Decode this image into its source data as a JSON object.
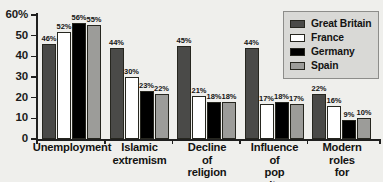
{
  "chart_data": {
    "type": "bar",
    "title": "",
    "xlabel": "",
    "ylabel": "",
    "ylim": [
      0,
      60
    ],
    "yticks": [
      "0",
      "10",
      "20",
      "30",
      "40",
      "50",
      "60%"
    ],
    "ytick_values": [
      0,
      10,
      20,
      30,
      40,
      50,
      60
    ],
    "grid": false,
    "legend_position": "top-right",
    "value_suffix": "%",
    "categories": [
      "Unemployment",
      "Islamic\nextremism",
      "Decline of\nreligion",
      "Influence of\npop culture",
      "Modern roles\nfor women"
    ],
    "series": [
      {
        "name": "Great Britain",
        "color": "#4a4a48",
        "values": [
          46,
          44,
          45,
          44,
          22
        ],
        "labels": [
          "46%",
          "44%",
          "45%",
          "44%",
          "22%"
        ]
      },
      {
        "name": "France",
        "color": "#ffffff",
        "values": [
          52,
          30,
          21,
          17,
          16
        ],
        "labels": [
          "52%",
          "30%",
          "21%",
          "17%",
          "16%"
        ]
      },
      {
        "name": "Germany",
        "color": "#000000",
        "values": [
          56,
          23,
          18,
          18,
          9
        ],
        "labels": [
          "56%",
          "23%",
          "18%",
          "18%",
          "9%"
        ]
      },
      {
        "name": "Spain",
        "color": "#9c9c99",
        "values": [
          55,
          22,
          18,
          17,
          10
        ],
        "labels": [
          "55%",
          "22%",
          "18%",
          "17%",
          "10%"
        ]
      }
    ]
  },
  "legend": {
    "items": [
      {
        "label": "Great Britain",
        "key": "gb"
      },
      {
        "label": "France",
        "key": "fr"
      },
      {
        "label": "Germany",
        "key": "de"
      },
      {
        "label": "Spain",
        "key": "es"
      }
    ]
  }
}
